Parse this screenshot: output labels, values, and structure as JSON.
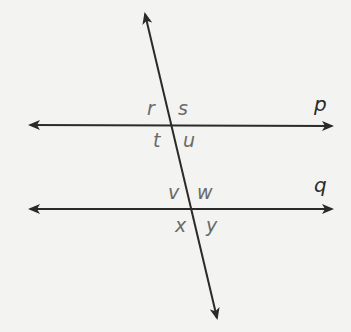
{
  "diagram": {
    "type": "parallel-lines-cut-by-transversal",
    "colors": {
      "background": "#f3f3f1",
      "line": "#2a2a2a",
      "angle_label": "#6a6a6a",
      "line_label": "#2a2a2a"
    },
    "lines": {
      "p": {
        "label": "p",
        "from": [
          28,
          125
        ],
        "to": [
          334,
          126
        ]
      },
      "q": {
        "label": "q",
        "from": [
          28,
          209
        ],
        "to": [
          334,
          209
        ]
      },
      "transversal": {
        "from": [
          144,
          12
        ],
        "to": [
          218,
          320
        ]
      }
    },
    "angles": {
      "r": "r",
      "s": "s",
      "t": "t",
      "u": "u",
      "v": "v",
      "w": "w",
      "x": "x",
      "y": "y"
    }
  }
}
